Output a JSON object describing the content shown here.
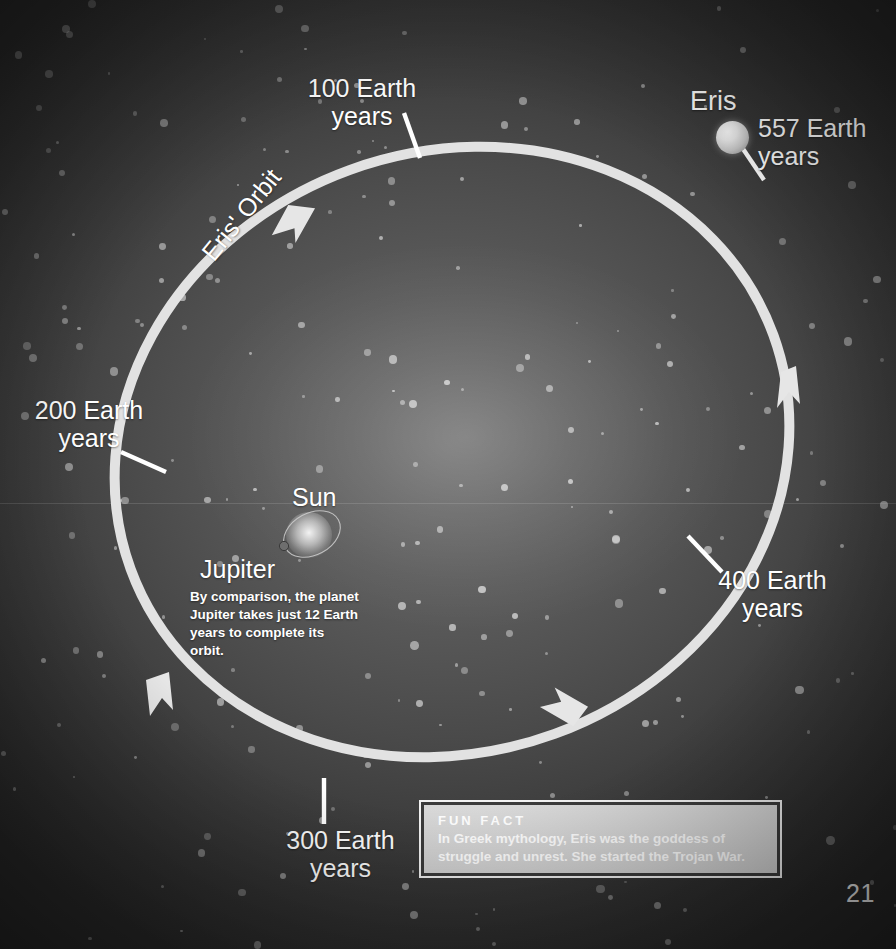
{
  "page": {
    "number": "21",
    "background_color": "#4a4a4a",
    "accent_color": "#e9e9e9"
  },
  "diagram": {
    "orbit_label": "Eris' Orbit",
    "sun_label": "Sun",
    "jupiter_label": "Jupiter",
    "jupiter_note": "By comparison, the planet Jupiter takes just 12 Earth years to complete its orbit.",
    "eris_label": "Eris",
    "eris_period_label": "557 Earth\nyears",
    "tick_labels": [
      {
        "id": "t100",
        "text": "100 Earth\nyears",
        "years": 100
      },
      {
        "id": "t200",
        "text": "200 Earth\nyears",
        "years": 200
      },
      {
        "id": "t300",
        "text": "300 Earth\nyears",
        "years": 300
      },
      {
        "id": "t400",
        "text": "400 Earth\nyears",
        "years": 400
      },
      {
        "id": "t557",
        "text": "557 Earth\nyears",
        "years": 557
      }
    ]
  },
  "fun_fact": {
    "title": "FUN FACT",
    "body": "In Greek mythology, Eris was the goddess of struggle and unrest. She started the Trojan War."
  },
  "chart_data": {
    "type": "diagram",
    "title": "Eris' Orbit",
    "orbit_shape": "ellipse",
    "orbit_center_px": [
      450,
      450
    ],
    "orbit_radii_px": [
      340,
      300
    ],
    "orbit_rotation_deg": -20,
    "orbit_direction": "counter-clockwise",
    "bodies": [
      {
        "name": "Sun",
        "type": "star",
        "position": "center-left-inner"
      },
      {
        "name": "Jupiter",
        "type": "planet",
        "orbit_period_years": 12
      },
      {
        "name": "Eris",
        "type": "dwarf-planet",
        "orbit_period_years": 557
      }
    ],
    "tick_marks_years": [
      100,
      200,
      300,
      400,
      557
    ],
    "unit": "Earth years",
    "legend": "none",
    "grid": false
  }
}
